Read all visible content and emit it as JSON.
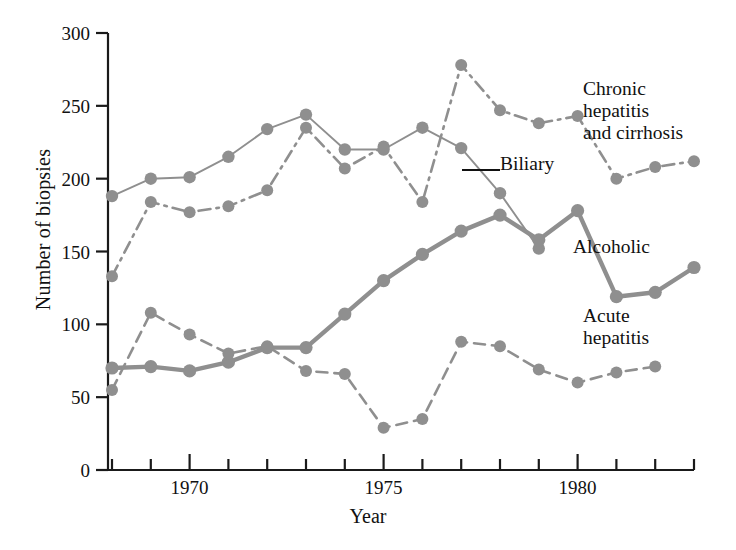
{
  "figure": {
    "xlabel": "Year",
    "ylabel": "Number of biopsies"
  },
  "annotations": {
    "chronic": "Chronic\nhepatitis\nand cirrhosis",
    "biliary": "Biliary",
    "alcoholic": "Alcoholic",
    "acute": "Acute\nhepatitis"
  },
  "style": {
    "series_color": "#8f8f8f",
    "axis_color": "#1a1a1a",
    "text_color": "#111111",
    "background": "#ffffff"
  },
  "chart_data": {
    "type": "line",
    "title": "",
    "xlabel": "Year",
    "ylabel": "Number of biopsies",
    "xlim": [
      1968,
      1983
    ],
    "ylim": [
      0,
      300
    ],
    "grid": false,
    "legend": "inline-annotations",
    "yticks": [
      0,
      50,
      100,
      150,
      200,
      250,
      300
    ],
    "ytick_labels": [
      "0",
      "50",
      "100",
      "150",
      "200",
      "250",
      "300"
    ],
    "xticks": [
      1968,
      1969,
      1970,
      1971,
      1972,
      1973,
      1974,
      1975,
      1976,
      1977,
      1978,
      1979,
      1980,
      1981,
      1982,
      1983
    ],
    "xtick_labels": [
      "",
      "",
      "1970",
      "",
      "",
      "",
      "",
      "1975",
      "",
      "",
      "",
      "",
      "1980",
      "",
      "",
      ""
    ],
    "x": [
      1968,
      1969,
      1970,
      1971,
      1972,
      1973,
      1974,
      1975,
      1976,
      1977,
      1978,
      1979,
      1980,
      1981,
      1982,
      1983
    ],
    "series": [
      {
        "name": "Chronic hepatitis and cirrhosis",
        "linestyle": "dashdot",
        "color": "#8f8f8f",
        "values": [
          133,
          184,
          177,
          181,
          192,
          235,
          207,
          222,
          184,
          278,
          247,
          238,
          243,
          200,
          208,
          212
        ]
      },
      {
        "name": "Biliary",
        "linestyle": "solid-thin",
        "color": "#8f8f8f",
        "values": [
          188,
          200,
          201,
          215,
          234,
          244,
          220,
          220,
          235,
          221,
          190,
          152,
          null,
          null,
          null,
          null
        ]
      },
      {
        "name": "Alcoholic",
        "linestyle": "solid-thick",
        "color": "#8f8f8f",
        "values": [
          70,
          71,
          68,
          74,
          84,
          84,
          107,
          130,
          148,
          164,
          175,
          158,
          178,
          119,
          122,
          139
        ]
      },
      {
        "name": "Acute hepatitis",
        "linestyle": "dashed",
        "color": "#8f8f8f",
        "values": [
          55,
          108,
          93,
          80,
          85,
          68,
          66,
          29,
          35,
          88,
          85,
          69,
          60,
          67,
          71,
          null
        ]
      }
    ]
  }
}
